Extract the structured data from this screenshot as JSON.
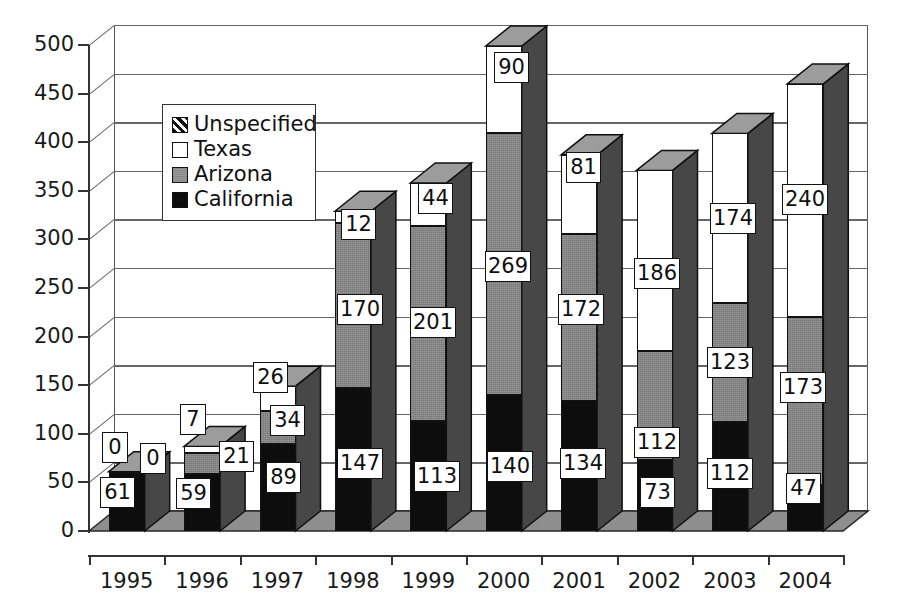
{
  "chart_data": {
    "type": "bar",
    "subtype": "stacked-3d-column",
    "title": "",
    "xlabel": "",
    "ylabel": "",
    "ylim": [
      0,
      500
    ],
    "ytick_step": 50,
    "grid": true,
    "legend_position": "upper-left-inside",
    "categories": [
      "1995",
      "1996",
      "1997",
      "1998",
      "1999",
      "2000",
      "2001",
      "2002",
      "2003",
      "2004"
    ],
    "yticks": [
      "0",
      "50",
      "100",
      "150",
      "200",
      "250",
      "300",
      "350",
      "400",
      "450",
      "500"
    ],
    "series": [
      {
        "name": "California",
        "color": "#0d0d0d",
        "values": [
          61,
          59,
          89,
          147,
          113,
          140,
          134,
          73,
          112,
          47
        ]
      },
      {
        "name": "Arizona",
        "color": "#858585",
        "values": [
          0,
          21,
          34,
          170,
          201,
          269,
          172,
          112,
          123,
          173
        ]
      },
      {
        "name": "Texas",
        "color": "#ffffff",
        "values": [
          0,
          7,
          26,
          12,
          44,
          90,
          81,
          186,
          174,
          240
        ]
      },
      {
        "name": "Unspecified",
        "color": "#hatch",
        "values": [
          0,
          0,
          0,
          0,
          0,
          0,
          0,
          0,
          0,
          0
        ]
      }
    ],
    "totals": [
      61,
      87,
      149,
      329,
      358,
      499,
      387,
      371,
      409,
      460
    ],
    "data_labels": [
      {
        "category": "1995",
        "California": "61",
        "Arizona": "0",
        "Texas": "0"
      },
      {
        "category": "1996",
        "California": "59",
        "Arizona": "21",
        "Texas": "7"
      },
      {
        "category": "1997",
        "California": "89",
        "Arizona": "34",
        "Texas": "26"
      },
      {
        "category": "1998",
        "California": "147",
        "Arizona": "170",
        "Texas": "12"
      },
      {
        "category": "1999",
        "California": "113",
        "Arizona": "201",
        "Texas": "44"
      },
      {
        "category": "2000",
        "California": "140",
        "Arizona": "269",
        "Texas": "90"
      },
      {
        "category": "2001",
        "California": "134",
        "Arizona": "172",
        "Texas": "81"
      },
      {
        "category": "2002",
        "California": "73",
        "Arizona": "112",
        "Texas": "186"
      },
      {
        "category": "2003",
        "California": "112",
        "Arizona": "123",
        "Texas": "174"
      },
      {
        "category": "2004",
        "California": "47",
        "Arizona": "173",
        "Texas": "240"
      }
    ]
  },
  "legend": {
    "items": [
      {
        "label": "Unspecified",
        "swatch": "unspecified"
      },
      {
        "label": "Texas",
        "swatch": "texas"
      },
      {
        "label": "Arizona",
        "swatch": "arizona"
      },
      {
        "label": "California",
        "swatch": "california"
      }
    ]
  }
}
